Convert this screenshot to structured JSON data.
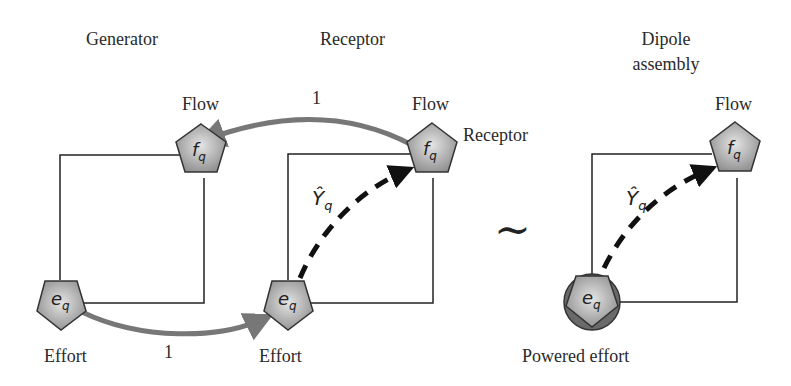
{
  "sections": {
    "generator": {
      "title": "Generator",
      "flow_label": "Flow",
      "effort_label": "Effort"
    },
    "receptor": {
      "title": "Receptor",
      "flow_label": "Flow",
      "effort_label": "Effort",
      "side_label": "Receptor",
      "admittance": "Ŷ"
    },
    "dipole": {
      "title_line1": "Dipole",
      "title_line2": "assembly",
      "flow_label": "Flow",
      "effort_label": "Powered effort",
      "admittance": "Ŷ"
    }
  },
  "symbols": {
    "flow": "f",
    "effort": "e",
    "subscript": "q"
  },
  "arrows": {
    "top_gain": "1",
    "bottom_gain": "1"
  },
  "equivalence": "~",
  "colors": {
    "node_fill": "#9a9a9a",
    "gray_arrow": "#777777",
    "dashed_arrow": "#111111",
    "line": "#222222"
  }
}
